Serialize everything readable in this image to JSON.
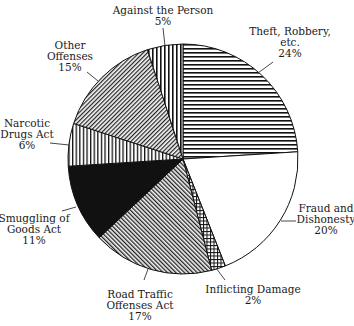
{
  "chart_data": {
    "type": "pie",
    "title": "",
    "start_angle_deg": -90,
    "direction": "clockwise",
    "center": [
      183,
      159
    ],
    "radius": 115,
    "slices": [
      {
        "label": "Theft, Robbery, etc.",
        "label_lines": [
          "Theft, Robbery,",
          "etc.",
          "24%"
        ],
        "value": 24,
        "pattern": "hlines"
      },
      {
        "label": "Fraud and Dishonesty",
        "label_lines": [
          "Fraud and",
          "Dishonesty",
          "20%"
        ],
        "value": 20,
        "pattern": "white"
      },
      {
        "label": "Inflicting Damage",
        "label_lines": [
          "Inflicting Damage",
          "2%"
        ],
        "value": 2,
        "pattern": "crosshatch"
      },
      {
        "label": "Road Traffic Offenses Act",
        "label_lines": [
          "Road Traffic",
          "Offenses Act",
          "17%"
        ],
        "value": 17,
        "pattern": "diag-fwd"
      },
      {
        "label": "Smuggling of Goods Act",
        "label_lines": [
          "Smuggling of",
          "Goods Act",
          "11%"
        ],
        "value": 11,
        "pattern": "black"
      },
      {
        "label": "Narcotic Drugs Act",
        "label_lines": [
          "Narcotic",
          "Drugs Act",
          "6%"
        ],
        "value": 6,
        "pattern": "vlines"
      },
      {
        "label": "Other Offenses",
        "label_lines": [
          "Other",
          "Offenses",
          "15%"
        ],
        "value": 15,
        "pattern": "diag-back"
      },
      {
        "label": "Against the Person",
        "label_lines": [
          "Against the Person",
          "5%"
        ],
        "value": 5,
        "pattern": "vlines-wide"
      }
    ],
    "units": "%",
    "legend": "none (direct labels with leader lines)"
  }
}
